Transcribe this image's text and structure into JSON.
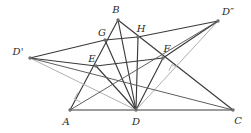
{
  "figure": {
    "kind": "euclidean-geometry-diagram",
    "width": 251,
    "height": 133,
    "background_color": "#ffffff",
    "colors": {
      "dark_stroke": "#3a3a3a",
      "mid_stroke": "#555555",
      "light_stroke": "#b0b0b0",
      "point_fill": "#6e6e6e",
      "label_color": "#2b2b2b"
    },
    "points": [
      {
        "id": "A",
        "label": "A",
        "x": 70,
        "y": 110,
        "label_x": 66,
        "label_y": 122
      },
      {
        "id": "B",
        "label": "B",
        "x": 118,
        "y": 20,
        "label_x": 116,
        "label_y": 10
      },
      {
        "id": "C",
        "label": "C",
        "x": 233,
        "y": 110,
        "label_x": 238,
        "label_y": 121
      },
      {
        "id": "D",
        "label": "D",
        "x": 136,
        "y": 110,
        "label_x": 136,
        "label_y": 122
      },
      {
        "id": "E",
        "label": "E",
        "x": 96,
        "y": 66,
        "label_x": 92,
        "label_y": 59
      },
      {
        "id": "F",
        "label": "F",
        "x": 163,
        "y": 58,
        "label_x": 167,
        "label_y": 49
      },
      {
        "id": "G",
        "label": "G",
        "x": 105,
        "y": 40,
        "label_x": 102,
        "label_y": 33
      },
      {
        "id": "H",
        "label": "H",
        "x": 138,
        "y": 37,
        "label_x": 141,
        "label_y": 29
      },
      {
        "id": "D1",
        "label": "D'",
        "x": 30,
        "y": 58,
        "label_x": 18,
        "label_y": 52
      },
      {
        "id": "D2",
        "label": "D″",
        "x": 218,
        "y": 21,
        "label_x": 228,
        "label_y": 12
      }
    ],
    "segments": [
      {
        "name": "side-AC",
        "from": "A",
        "to": "C",
        "shade": "dark"
      },
      {
        "name": "side-AB",
        "from": "A",
        "to": "B",
        "shade": "dark"
      },
      {
        "name": "side-BC",
        "from": "B",
        "to": "C",
        "shade": "dark"
      },
      {
        "name": "altitude-BD",
        "from": "B",
        "to": "D",
        "shade": "dark"
      },
      {
        "name": "cevian-DG",
        "from": "D",
        "to": "G",
        "shade": "dark"
      },
      {
        "name": "cevian-DE",
        "from": "D",
        "to": "E",
        "shade": "dark"
      },
      {
        "name": "cevian-DF",
        "from": "D",
        "to": "F",
        "shade": "dark"
      },
      {
        "name": "cevian-DH",
        "from": "D",
        "to": "H",
        "shade": "dark"
      },
      {
        "name": "reflection-DD1",
        "from": "D",
        "to": "D1",
        "shade": "light"
      },
      {
        "name": "reflection-DD2",
        "from": "D",
        "to": "D2",
        "shade": "light"
      },
      {
        "name": "line-D1-E",
        "from": "D1",
        "to": "E",
        "shade": "dark"
      },
      {
        "name": "line-E-F",
        "from": "E",
        "to": "F",
        "shade": "dark"
      },
      {
        "name": "line-F-D2",
        "from": "F",
        "to": "D2",
        "shade": "dark"
      },
      {
        "name": "line-D1-G",
        "from": "D1",
        "to": "G",
        "shade": "dark"
      },
      {
        "name": "line-G-H",
        "from": "G",
        "to": "H",
        "shade": "dark"
      },
      {
        "name": "line-H-D2",
        "from": "H",
        "to": "D2",
        "shade": "dark"
      },
      {
        "name": "line-D1-C",
        "from": "D1",
        "to": "C",
        "shade": "mid"
      },
      {
        "name": "line-D2-A",
        "from": "D2",
        "to": "A",
        "shade": "mid"
      }
    ],
    "right_angle_marks": [
      {
        "name": "right-angle-at-AB-foot",
        "x": 84,
        "y": 96,
        "size": 7,
        "rotation": -62
      },
      {
        "name": "right-angle-at-BC-foot",
        "x": 175,
        "y": 74,
        "size": 7,
        "rotation": 28
      }
    ]
  }
}
